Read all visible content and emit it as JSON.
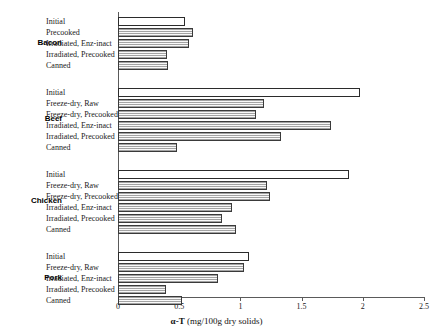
{
  "chart_data": {
    "type": "bar",
    "orientation": "horizontal",
    "title": "",
    "xlabel": "α-T (mg/100g dry solids)",
    "ylabel": "",
    "xlim": [
      0,
      2.5
    ],
    "xticks": [
      0,
      0.5,
      1,
      1.5,
      2,
      2.5
    ],
    "xtick_labels": [
      "0",
      "0.5",
      "1",
      "1.5",
      "2",
      "2.5"
    ],
    "grid": false,
    "legend": null,
    "groups": [
      {
        "name": "Bacon",
        "categories": [
          "Initial",
          "Precooked",
          "Irradiated, Enz-inact",
          "Irradiated, Precooked",
          "Canned"
        ],
        "values": [
          0.55,
          0.61,
          0.58,
          0.4,
          0.41
        ],
        "styles": [
          "open",
          "hatched",
          "hatched",
          "hatched",
          "hatched"
        ]
      },
      {
        "name": "Beef",
        "categories": [
          "Initial",
          "Freeze-dry, Raw",
          "Freeze-dry, Precooked",
          "Irradiated, Enz-inact",
          "Irradiated, Precooked",
          "Canned"
        ],
        "values": [
          1.98,
          1.19,
          1.13,
          1.74,
          1.33,
          0.48
        ],
        "styles": [
          "open",
          "hatched",
          "hatched",
          "hatched",
          "hatched",
          "hatched"
        ]
      },
      {
        "name": "Chicken",
        "categories": [
          "Initial",
          "Freeze-dry, Raw",
          "Freeze-dry, Precooked",
          "Irradiated, Enz-inact",
          "Irradiated, Precooked",
          "Canned"
        ],
        "values": [
          1.89,
          1.22,
          1.24,
          0.93,
          0.85,
          0.96
        ],
        "styles": [
          "open",
          "hatched",
          "hatched",
          "hatched",
          "hatched",
          "hatched"
        ]
      },
      {
        "name": "Pork",
        "categories": [
          "Initial",
          "Freeze-dry, Raw",
          "Irradiated, Enz-inact",
          "Irradiated, Precooked",
          "Canned"
        ],
        "values": [
          1.07,
          1.03,
          0.82,
          0.39,
          0.52
        ],
        "styles": [
          "open",
          "hatched",
          "hatched",
          "hatched",
          "hatched"
        ]
      }
    ]
  },
  "axis": {
    "title_symbol": "α-T",
    "title_units": " (mg/100g dry solids)"
  },
  "colors": {
    "bar_open_fill": "#ffffff",
    "bar_hatched_fill": "#d8d8d8",
    "bar_border": "#2b2b2b",
    "axis_line": "#5a5a5a",
    "text": "#1a1a1a"
  }
}
